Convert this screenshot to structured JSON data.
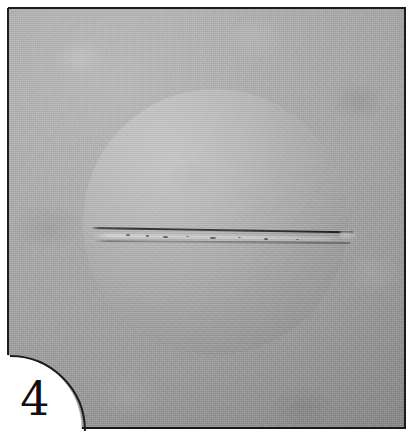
{
  "figure": {
    "kind": "photographic-plate",
    "plate_number": "4",
    "caption": "",
    "background_color": "#ffffff",
    "plate_color": "#a3a3a3",
    "border_color": "#1b1b1b"
  },
  "plate": {
    "name": "specimen-plate",
    "shape": "square-with-quarter-circle-corner-cutout",
    "cutout_corner": "bottom-left",
    "surface": "matte grey granular photographic ground"
  },
  "specimen": {
    "name": "circular-disc-specimen",
    "shape": "circle",
    "center_x": 215,
    "center_y": 221,
    "radius": 132,
    "relief": "raised",
    "light_direction": "upper-left",
    "highlight_edge": "left",
    "shadow_edge": "right",
    "highlight_color": "#f2f2f2",
    "shadow_color": "#141414",
    "face_color": "#b0b0b0"
  },
  "feature": {
    "name": "horizontal-fracture",
    "description": "diametral crack running left to right across the disc",
    "orientation": "horizontal",
    "tilt_degrees": 0.95,
    "line_color": "#262626",
    "lip_highlight_color": "#ffffff",
    "reaches_rim": "right",
    "secondary_trace": true
  },
  "label": {
    "number_text": "4",
    "number_color": "#101010",
    "position": "bottom-left-cutout"
  },
  "specks": [
    {
      "x": 126,
      "y": 234,
      "w": 4,
      "h": 2
    },
    {
      "x": 146,
      "y": 235,
      "w": 3,
      "h": 2
    },
    {
      "x": 163,
      "y": 236,
      "w": 5,
      "h": 2
    },
    {
      "x": 186,
      "y": 236,
      "w": 3,
      "h": 1
    },
    {
      "x": 210,
      "y": 237,
      "w": 6,
      "h": 2
    },
    {
      "x": 238,
      "y": 237,
      "w": 3,
      "h": 1
    },
    {
      "x": 264,
      "y": 238,
      "w": 4,
      "h": 2
    },
    {
      "x": 296,
      "y": 239,
      "w": 3,
      "h": 1
    }
  ]
}
